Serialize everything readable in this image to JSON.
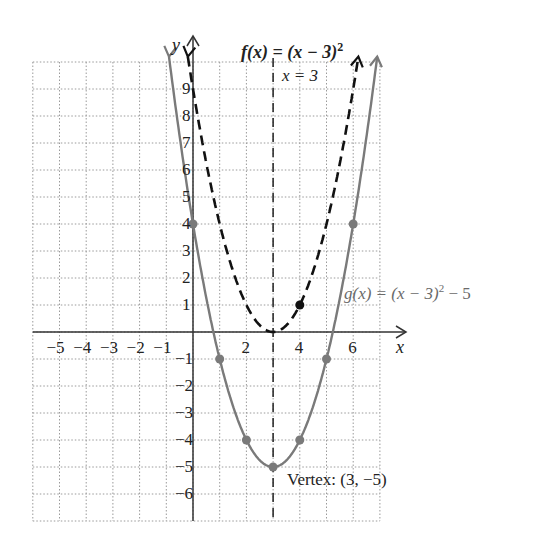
{
  "chart_data": {
    "type": "line",
    "title": "",
    "xlabel": "x",
    "ylabel": "y",
    "xlim": [
      -6,
      7
    ],
    "ylim": [
      -7,
      10
    ],
    "grid": true,
    "x_tick_labels": [
      "-5",
      "-4",
      "-3",
      "-2",
      "-1",
      "2",
      "4",
      "6"
    ],
    "y_tick_labels": [
      "9",
      "8",
      "7",
      "6",
      "5",
      "4",
      "3",
      "2",
      "1",
      "-1",
      "-2",
      "-3",
      "-4",
      "-5",
      "-6"
    ],
    "series": [
      {
        "name": "f(x) = (x - 3)^2",
        "style": "dashed",
        "color": "#111111",
        "marked_points": [
          [
            4,
            1
          ]
        ]
      },
      {
        "name": "g(x) = (x - 3)^2 - 5",
        "style": "solid",
        "color": "#7a7a7a",
        "marked_points": [
          [
            0,
            4
          ],
          [
            1,
            -1
          ],
          [
            2,
            -4
          ],
          [
            3,
            -5
          ],
          [
            4,
            -4
          ],
          [
            5,
            -1
          ],
          [
            6,
            4
          ]
        ]
      }
    ],
    "annotations": [
      {
        "text": "x = 3",
        "type": "axis of symmetry (dashed vertical line)"
      },
      {
        "text": "Vertex: (3, −5)",
        "at": [
          3,
          -5
        ]
      }
    ]
  },
  "labels": {
    "f_label": "f(x) = (x − 3)",
    "f_exp": "2",
    "g_label": "g(x) = (x − 3)",
    "g_exp": "2",
    "g_tail": " − 5",
    "axis_of_symmetry": "x = 3",
    "vertex": "Vertex: (3, −5)",
    "x_axis": "x",
    "y_axis": "y"
  },
  "ticks": {
    "x": [
      {
        "v": -5,
        "t": "−5"
      },
      {
        "v": -4,
        "t": "−4"
      },
      {
        "v": -3,
        "t": "−3"
      },
      {
        "v": -2,
        "t": "−2"
      },
      {
        "v": -1,
        "t": "−1"
      },
      {
        "v": 2,
        "t": "2"
      },
      {
        "v": 4,
        "t": "4"
      },
      {
        "v": 6,
        "t": "6"
      }
    ],
    "y": [
      {
        "v": 9,
        "t": "9"
      },
      {
        "v": 8,
        "t": "8"
      },
      {
        "v": 7,
        "t": "7"
      },
      {
        "v": 6,
        "t": "6"
      },
      {
        "v": 5,
        "t": "5"
      },
      {
        "v": 4,
        "t": "4"
      },
      {
        "v": 3,
        "t": "3"
      },
      {
        "v": 2,
        "t": "2"
      },
      {
        "v": 1,
        "t": "1"
      },
      {
        "v": -1,
        "t": "−1"
      },
      {
        "v": -2,
        "t": "−2"
      },
      {
        "v": -3,
        "t": "−3"
      },
      {
        "v": -4,
        "t": "−4"
      },
      {
        "v": -5,
        "t": "−5"
      },
      {
        "v": -6,
        "t": "−6"
      }
    ]
  },
  "colors": {
    "f_curve": "#111111",
    "g_curve": "#7a7a7a",
    "grid": "#9a9a9a",
    "axis": "#333333"
  }
}
